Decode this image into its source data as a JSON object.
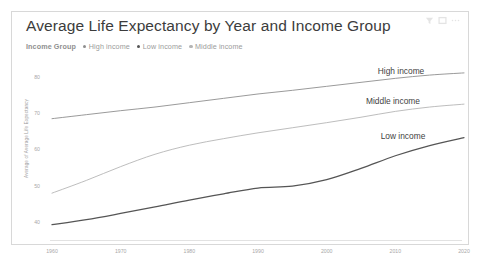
{
  "card": {
    "title": "Average Life Expectancy by Year and Income Group"
  },
  "toolbar": {
    "icons": [
      {
        "name": "filter-icon",
        "glyph": "filter"
      },
      {
        "name": "focus-mode-icon",
        "glyph": "square"
      },
      {
        "name": "more-options-icon",
        "glyph": "ellipsis"
      }
    ]
  },
  "legend": {
    "title": "Income Group",
    "items": [
      {
        "label": "High income",
        "color": "#8e8e8e"
      },
      {
        "label": "Low income",
        "color": "#555555"
      },
      {
        "label": "Middle income",
        "color": "#b5b5b5"
      }
    ]
  },
  "series_labels": [
    {
      "text": "High income",
      "x": 389,
      "y": 8
    },
    {
      "text": "Middle income",
      "x": 381,
      "y": 38
    },
    {
      "text": "Low income",
      "x": 391,
      "y": 73
    }
  ],
  "chart_data": {
    "type": "line",
    "title": "Average Life Expectancy by Year and Income Group",
    "xlabel": "",
    "ylabel": "Average of Average Life Expectancy",
    "xlim": [
      1960,
      2020
    ],
    "ylim": [
      35,
      84
    ],
    "yticks": [
      40,
      50,
      60,
      70,
      80
    ],
    "xticks": [
      1960,
      1970,
      1980,
      1990,
      2000,
      2010,
      2020
    ],
    "grid": false,
    "legend_position": "top-left",
    "x": [
      1960,
      1965,
      1970,
      1975,
      1980,
      1985,
      1990,
      1995,
      2000,
      2005,
      2010,
      2015,
      2020
    ],
    "series": [
      {
        "name": "High income",
        "color": "#8e8e8e",
        "values": [
          68.4,
          69.5,
          70.6,
          71.6,
          72.8,
          74.0,
          75.2,
          76.2,
          77.3,
          78.4,
          79.5,
          80.4,
          81.0
        ]
      },
      {
        "name": "Middle income",
        "color": "#b5b5b5",
        "values": [
          47.9,
          51.4,
          55.2,
          58.6,
          61.1,
          62.9,
          64.5,
          65.9,
          67.3,
          68.8,
          70.4,
          71.6,
          72.4
        ]
      },
      {
        "name": "Low income",
        "color": "#555555",
        "values": [
          39.2,
          40.6,
          42.3,
          44.1,
          46.0,
          47.7,
          49.3,
          49.8,
          51.6,
          54.7,
          58.2,
          61.0,
          63.2
        ]
      }
    ]
  }
}
